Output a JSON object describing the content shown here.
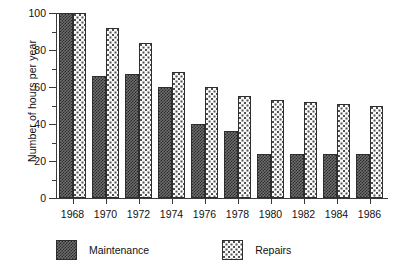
{
  "chart_data": {
    "type": "bar",
    "title": "",
    "xlabel": "",
    "ylabel": "Number of hours per year",
    "categories": [
      "1968",
      "1970",
      "1972",
      "1974",
      "1976",
      "1978",
      "1980",
      "1982",
      "1984",
      "1986"
    ],
    "series": [
      {
        "name": "Maintenance",
        "values": [
          100,
          66,
          67,
          60,
          40,
          36,
          24,
          24,
          24,
          24
        ]
      },
      {
        "name": "Repairs",
        "values": [
          100,
          92,
          84,
          68,
          60,
          55,
          53,
          52,
          51,
          50
        ]
      }
    ],
    "ylim": [
      0,
      100
    ],
    "ytick_labels": [
      "0",
      "20",
      "40",
      "60",
      "80",
      "100"
    ],
    "ytick_values": [
      0,
      20,
      40,
      60,
      80,
      100
    ],
    "yminor_values": [
      10,
      30,
      50,
      70,
      90
    ],
    "grid": false,
    "legend_position": "bottom-left"
  },
  "legend": {
    "items": [
      {
        "label": "Maintenance",
        "pattern": "dark-crosshatch",
        "color": "#2b2b2b"
      },
      {
        "label": "Repairs",
        "pattern": "light-dotted",
        "color": "#fbfbfb"
      }
    ]
  },
  "colors": {
    "maintenance": "#2b2b2b",
    "repairs": "#fbfbfb",
    "axis": "#3a3a3a",
    "background": "#ffffff"
  }
}
